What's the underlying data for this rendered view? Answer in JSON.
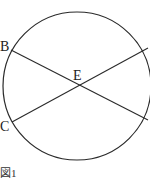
{
  "figure": {
    "caption": "図1",
    "points": {
      "B": "B",
      "C": "C",
      "E": "E"
    },
    "circle": {
      "cx": 77,
      "cy": 86,
      "r": 74
    },
    "chords": [
      {
        "name": "chord-from-B",
        "x1": 11,
        "y1": 50,
        "x2": 148,
        "y2": 120
      },
      {
        "name": "chord-from-C",
        "x1": 12,
        "y1": 122,
        "x2": 148,
        "y2": 48
      }
    ],
    "stroke_color": "#2a2a2a"
  }
}
